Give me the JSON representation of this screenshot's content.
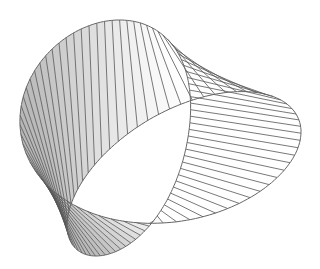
{
  "figure": {
    "width": 320,
    "height": 269,
    "background": "#ffffff",
    "line_color": "#555555",
    "edge_color": "#666666",
    "shade_dark": "#b8b8b8",
    "shade_light": "#f2f2f2",
    "ruling_count": 72,
    "outer_top_edge": {
      "cx": 165,
      "cy": 100,
      "rx": 136,
      "ry": 80
    },
    "hole": {
      "cx": 158,
      "cy": 132,
      "rx": 44,
      "ry": 13
    },
    "outer_bottom_edge": {
      "cx": 160,
      "cy": 140,
      "rx": 142,
      "ry": 116
    }
  }
}
